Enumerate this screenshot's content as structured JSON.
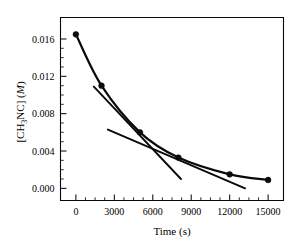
{
  "chart_data": {
    "type": "line",
    "title": "",
    "subtitle": "",
    "xlabel": "Time (s)",
    "ylabel_parts": {
      "prefix": "[CH",
      "subscript": "3",
      "middle": "NC] (",
      "italic": "M",
      "suffix": ")"
    },
    "ylabel": "[CH3NC] (M)",
    "xlim": [
      -1200,
      16200
    ],
    "ylim": [
      -0.0013,
      0.0183
    ],
    "xticks": [
      0,
      3000,
      6000,
      9000,
      12000,
      15000
    ],
    "xtick_labels": [
      "0",
      "3000",
      "6000",
      "9000",
      "12000",
      "15000"
    ],
    "yticks": [
      0.0,
      0.004,
      0.008,
      0.012,
      0.016
    ],
    "ytick_labels": [
      "0.000",
      "0.004",
      "0.008",
      "0.012",
      "0.016"
    ],
    "x_minor_step": 750,
    "y_minor_step": 0.001,
    "grid": false,
    "legend": null,
    "series": [
      {
        "name": "[CH3NC] decay",
        "marker": "filled-circle",
        "x": [
          0,
          2000,
          5000,
          8000,
          12000,
          15000
        ],
        "values": [
          0.0165,
          0.011,
          0.006,
          0.0033,
          0.0015,
          0.0009
        ]
      },
      {
        "name": "tangent at 2000 s",
        "marker": "none",
        "x": [
          1400,
          8200
        ],
        "values": [
          0.0109,
          0.001
        ]
      },
      {
        "name": "tangent at 5000 s",
        "marker": "none",
        "x": [
          2500,
          13200
        ],
        "values": [
          0.0063,
          0.0
        ]
      }
    ]
  },
  "figure": {
    "background_color": "#ffffff",
    "ink_color": "#0a0a0a"
  }
}
